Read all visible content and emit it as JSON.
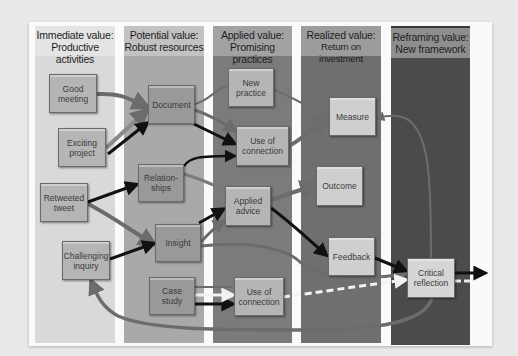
{
  "columns": [
    {
      "line1": "Immediate value:",
      "line2": "Productive activities"
    },
    {
      "line1": "Potential value:",
      "line2": "Robust resources"
    },
    {
      "line1": "Applied value:",
      "line2": "Promising practices"
    },
    {
      "line1": "Realized value:",
      "line2": "Return on investment"
    },
    {
      "line1": "Reframing value:",
      "line2": "New framework"
    }
  ],
  "nodes": {
    "good_meeting": {
      "line1": "Good",
      "line2": "meeting"
    },
    "exciting_project": {
      "line1": "Exciting",
      "line2": "project"
    },
    "retweeted_tweet": {
      "line1": "Retweeted",
      "line2": "tweet"
    },
    "challenging_inquiry": {
      "line1": "Challenging",
      "line2": "inquiry"
    },
    "document": {
      "line1": "Document",
      "line2": ""
    },
    "relationships": {
      "line1": "Relation-",
      "line2": "ships"
    },
    "insight": {
      "line1": "Insight",
      "line2": ""
    },
    "case_study": {
      "line1": "Case",
      "line2": "study"
    },
    "new_practice": {
      "line1": "New",
      "line2": "practice"
    },
    "use_of_connection_top": {
      "line1": "Use of",
      "line2": "connection"
    },
    "applied_advice": {
      "line1": "Applied",
      "line2": "advice"
    },
    "use_of_connection_bottom": {
      "line1": "Use of",
      "line2": "connection"
    },
    "measure": {
      "line1": "Measure",
      "line2": ""
    },
    "outcome": {
      "line1": "Outcome",
      "line2": ""
    },
    "feedback": {
      "line1": "Feedback",
      "line2": ""
    },
    "critical_reflection": {
      "line1": "Critical",
      "line2": "reflection"
    }
  },
  "colors": {
    "arrow_black": "#111111",
    "arrow_gray": "#6c6c6c",
    "arrow_white": "#f2f2f2"
  }
}
